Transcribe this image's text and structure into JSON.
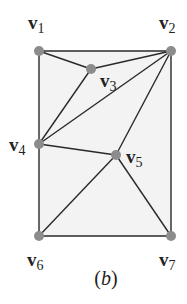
{
  "diagram": {
    "caption": "(b)",
    "caption_letter": "b",
    "colors": {
      "edge": "#2a2a2a",
      "vertex": "#8c8c8c",
      "fill": "#f3f3f3",
      "label": "#222222"
    },
    "vertices": [
      {
        "id": "v1",
        "label": "v",
        "sub": "1",
        "x": 39,
        "y": 51
      },
      {
        "id": "v2",
        "label": "v",
        "sub": "2",
        "x": 171,
        "y": 51
      },
      {
        "id": "v3",
        "label": "v",
        "sub": "3",
        "x": 91,
        "y": 69
      },
      {
        "id": "v4",
        "label": "v",
        "sub": "4",
        "x": 39,
        "y": 144
      },
      {
        "id": "v5",
        "label": "v",
        "sub": "5",
        "x": 116,
        "y": 155
      },
      {
        "id": "v6",
        "label": "v",
        "sub": "6",
        "x": 39,
        "y": 236
      },
      {
        "id": "v7",
        "label": "v",
        "sub": "7",
        "x": 171,
        "y": 236
      }
    ],
    "edges": [
      [
        "v1",
        "v2"
      ],
      [
        "v1",
        "v3"
      ],
      [
        "v1",
        "v4"
      ],
      [
        "v2",
        "v3"
      ],
      [
        "v2",
        "v4"
      ],
      [
        "v2",
        "v5"
      ],
      [
        "v2",
        "v7"
      ],
      [
        "v3",
        "v4"
      ],
      [
        "v4",
        "v5"
      ],
      [
        "v4",
        "v6"
      ],
      [
        "v5",
        "v6"
      ],
      [
        "v5",
        "v7"
      ],
      [
        "v6",
        "v7"
      ]
    ]
  }
}
